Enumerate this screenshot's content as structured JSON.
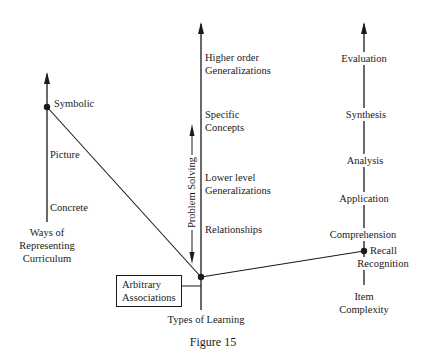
{
  "diagram": {
    "caption": "Figure 15",
    "left_axis": {
      "title_lines": [
        "Ways of",
        "Representing",
        "Curriculum"
      ],
      "labels": [
        "Symbolic",
        "Picture",
        "Concrete"
      ]
    },
    "center_axis": {
      "title": "Types of Learning",
      "labels": [
        [
          "Higher order",
          "Generalizations"
        ],
        [
          "Specific",
          "Concepts"
        ],
        [
          "Lower level",
          "Generalizations"
        ],
        [
          "Relationships"
        ]
      ],
      "boxed_label": [
        "Arbitrary",
        "Associations"
      ],
      "side_arrow_label": "Problem  Solving"
    },
    "right_axis": {
      "title_lines": [
        "Item",
        "Complexity"
      ],
      "labels": [
        "Evaluation",
        "Synthesis",
        "Analysis",
        "Application",
        "Comprehension",
        "Recall",
        "Recognition"
      ]
    },
    "colors": {
      "line": "#1a1a1a",
      "background": "#ffffff"
    }
  }
}
